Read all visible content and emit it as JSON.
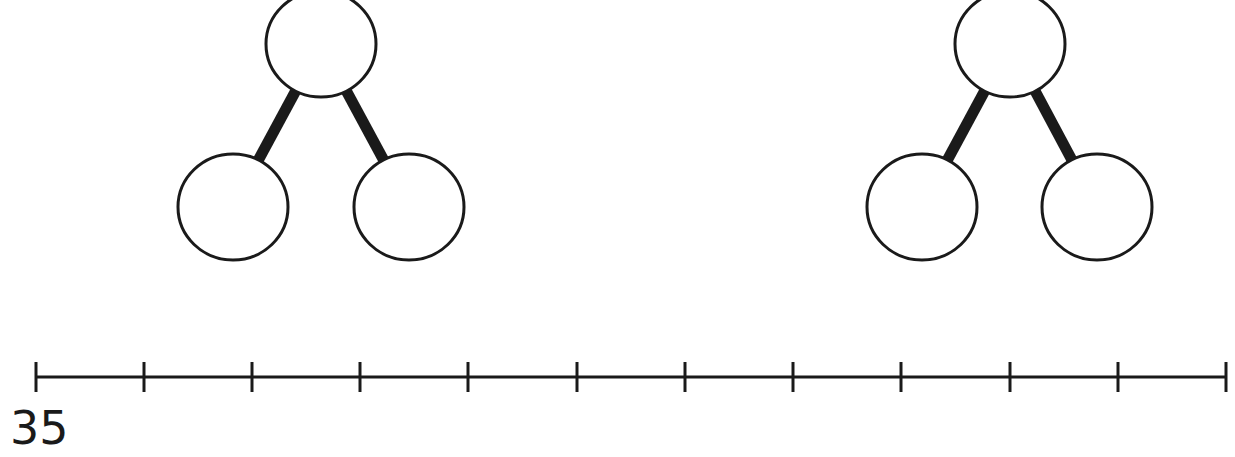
{
  "colors": {
    "stroke": "#1a1a1a",
    "fill": "#ffffff",
    "background": "#ffffff"
  },
  "number_bonds": [
    {
      "id": "bond-left",
      "top": {
        "cx": 321,
        "cy": 44,
        "r": 55,
        "value": ""
      },
      "left": {
        "cx": 233,
        "cy": 207,
        "r": 55,
        "value": ""
      },
      "right": {
        "cx": 409,
        "cy": 207,
        "r": 55,
        "value": ""
      }
    },
    {
      "id": "bond-right",
      "top": {
        "cx": 1010,
        "cy": 44,
        "r": 55,
        "value": ""
      },
      "left": {
        "cx": 922,
        "cy": 207,
        "r": 55,
        "value": ""
      },
      "right": {
        "cx": 1097,
        "cy": 207,
        "r": 55,
        "value": ""
      }
    }
  ],
  "number_line": {
    "y": 377,
    "x_start": 36,
    "x_end": 1226,
    "tick_count": 12,
    "tick_positions": [
      36,
      144,
      252,
      360,
      468,
      577,
      685,
      793,
      901,
      1010,
      1118,
      1226
    ],
    "labels": [
      {
        "tick_index": 0,
        "text": "35"
      }
    ]
  }
}
